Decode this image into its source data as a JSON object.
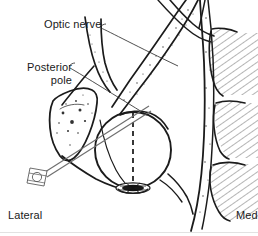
{
  "figure": {
    "kind": "anatomical-line-drawing",
    "background_color": "#ffffff",
    "ink_color": "#1b1b1b",
    "needle_color": "#6e6e6e",
    "width_px": 258,
    "height_px": 236
  },
  "labels": {
    "optic_nerve": "Optic nerve",
    "posterior_pole_line1": "Posterior",
    "posterior_pole_line2": "pole",
    "lateral": "Lateral",
    "medial": "Med"
  },
  "structures": [
    {
      "name": "globe",
      "description": "Eyeball, circular outline",
      "center": [
        133,
        150
      ],
      "radius": 38
    },
    {
      "name": "optic-nerve-band",
      "description": "Optic nerve running posteromedially from globe to orbital apex"
    },
    {
      "name": "posterior-pole-macula",
      "description": "Dark ellipse at posterior pole of globe",
      "center": [
        133,
        188
      ]
    },
    {
      "name": "lateral-orbital-wall",
      "description": "Stippled lateral orbital bone, upper left"
    },
    {
      "name": "medial-rectus-muscles",
      "description": "Three hatched muscle bellies along medial wall"
    },
    {
      "name": "needle",
      "description": "Retrobulbar needle entering inferolaterally toward orbital apex",
      "hub": [
        38,
        177
      ],
      "tip": [
        148,
        108
      ]
    },
    {
      "name": "visual-axis",
      "description": "Dashed vertical line marking visual axis through globe"
    }
  ],
  "orientation": {
    "left_marker": "Lateral",
    "right_marker": "Med"
  }
}
